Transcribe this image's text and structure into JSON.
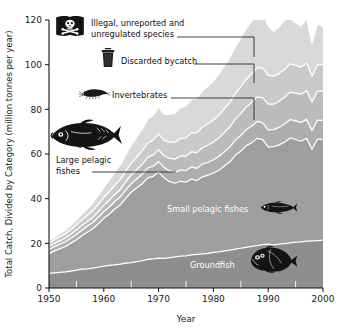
{
  "chart_data": {
    "type": "area",
    "stacked": true,
    "title": "",
    "subtitle": "",
    "xlabel": "Year",
    "ylabel": "Total Catch, Divided by Category (million tonnes per year)",
    "xlim": [
      1950,
      2000
    ],
    "ylim": [
      0,
      120
    ],
    "ytick_values": [
      0,
      20,
      40,
      60,
      80,
      100,
      120
    ],
    "ytick_labels": [
      "0",
      "20",
      "40",
      "60",
      "80",
      "100",
      "120"
    ],
    "xtick_values": [
      1950,
      1960,
      1970,
      1980,
      1990,
      2000
    ],
    "xtick_labels": [
      "1950",
      "1960",
      "1970",
      "1980",
      "1990",
      "2000"
    ],
    "xminor_values": [
      1955,
      1965,
      1975,
      1985,
      1995
    ],
    "grid": false,
    "legend_position": "inside-annotations",
    "x": [
      1950,
      1951,
      1952,
      1953,
      1954,
      1955,
      1956,
      1957,
      1958,
      1959,
      1960,
      1961,
      1962,
      1963,
      1964,
      1965,
      1966,
      1967,
      1968,
      1969,
      1970,
      1971,
      1972,
      1973,
      1974,
      1975,
      1976,
      1977,
      1978,
      1979,
      1980,
      1981,
      1982,
      1983,
      1984,
      1985,
      1986,
      1987,
      1988,
      1989,
      1990,
      1991,
      1992,
      1993,
      1994,
      1995,
      1996,
      1997,
      1998,
      1999,
      2000
    ],
    "series": [
      {
        "name": "Groundfish",
        "color": "#8e8e8e",
        "values": [
          6.5,
          6.8,
          7.0,
          7.2,
          7.6,
          8.0,
          8.4,
          8.6,
          8.9,
          9.3,
          9.8,
          10.1,
          10.4,
          10.7,
          11.1,
          11.4,
          11.8,
          12.2,
          12.8,
          13.0,
          13.4,
          13.3,
          13.6,
          13.9,
          14.3,
          14.4,
          14.8,
          15.1,
          15.3,
          15.5,
          15.9,
          16.2,
          16.6,
          17.0,
          17.4,
          17.8,
          18.2,
          18.6,
          19.0,
          19.4,
          19.6,
          19.3,
          19.6,
          19.9,
          20.2,
          20.5,
          20.7,
          21.0,
          21.1,
          21.2,
          21.4
        ]
      },
      {
        "name": "Small pelagic fishes",
        "color": "#9e9e9e",
        "values": [
          9.0,
          9.8,
          10.6,
          11.4,
          12.5,
          13.6,
          15.0,
          16.4,
          17.6,
          19.5,
          21.4,
          23.0,
          25.0,
          26.5,
          29.0,
          31.5,
          33.0,
          34.5,
          36.5,
          37.0,
          38.5,
          36.0,
          34.0,
          33.0,
          33.5,
          33.0,
          34.0,
          33.0,
          34.5,
          35.0,
          35.5,
          36.5,
          38.0,
          39.5,
          42.0,
          43.5,
          45.5,
          46.5,
          48.0,
          47.0,
          43.5,
          44.0,
          44.5,
          45.5,
          47.0,
          46.0,
          45.0,
          46.0,
          41.0,
          45.5,
          45.0
        ]
      },
      {
        "name": "Large pelagic fishes",
        "color": "#aeaeae",
        "values": [
          1.8,
          1.9,
          2.0,
          2.1,
          2.2,
          2.4,
          2.5,
          2.6,
          2.8,
          2.9,
          3.0,
          3.2,
          3.3,
          3.5,
          3.7,
          3.8,
          4.0,
          4.2,
          4.4,
          4.5,
          4.7,
          4.6,
          4.8,
          4.9,
          5.1,
          5.2,
          5.4,
          5.5,
          5.7,
          5.8,
          6.0,
          6.2,
          6.4,
          6.6,
          6.8,
          7.0,
          7.2,
          7.4,
          7.6,
          7.5,
          7.7,
          7.6,
          7.8,
          8.0,
          8.2,
          8.3,
          8.4,
          8.5,
          8.3,
          8.5,
          8.6
        ]
      },
      {
        "name": "Invertebrates",
        "color": "#bcbcbc",
        "values": [
          1.4,
          1.5,
          1.6,
          1.7,
          1.8,
          2.0,
          2.1,
          2.2,
          2.4,
          2.6,
          2.8,
          3.0,
          3.2,
          3.4,
          3.7,
          3.9,
          4.2,
          4.5,
          4.8,
          5.0,
          5.3,
          5.3,
          5.6,
          5.9,
          6.2,
          6.4,
          6.8,
          7.0,
          7.4,
          7.7,
          8.0,
          8.3,
          8.7,
          9.0,
          9.4,
          9.8,
          10.2,
          10.6,
          11.0,
          11.2,
          11.5,
          11.4,
          11.7,
          12.0,
          12.3,
          12.5,
          12.7,
          12.9,
          12.8,
          13.0,
          13.2
        ]
      },
      {
        "name": "Discarded bycatch",
        "color": "#cacaca",
        "values": [
          1.5,
          1.6,
          1.8,
          1.9,
          2.1,
          2.3,
          2.5,
          2.7,
          3.0,
          3.2,
          3.5,
          3.8,
          4.1,
          4.4,
          4.8,
          5.2,
          5.6,
          6.0,
          6.4,
          6.7,
          7.1,
          7.0,
          7.3,
          7.6,
          8.0,
          8.2,
          8.6,
          8.8,
          9.2,
          9.5,
          9.8,
          10.2,
          10.6,
          11.0,
          11.5,
          11.9,
          12.4,
          12.8,
          13.2,
          13.4,
          13.0,
          12.6,
          12.4,
          12.5,
          12.7,
          12.4,
          12.1,
          12.3,
          11.6,
          11.9,
          11.8
        ]
      },
      {
        "name": "Illegal, unreported and unregulated species",
        "color": "#d9d9d9",
        "values": [
          1.0,
          1.2,
          1.4,
          1.6,
          1.9,
          2.2,
          2.6,
          3.0,
          3.5,
          4.0,
          4.6,
          5.2,
          5.9,
          6.6,
          7.4,
          8.2,
          9.0,
          9.8,
          10.6,
          11.2,
          12.0,
          11.6,
          12.4,
          13.0,
          13.8,
          14.2,
          15.0,
          15.4,
          16.2,
          16.8,
          17.6,
          18.4,
          19.2,
          20.0,
          21.0,
          21.8,
          22.8,
          23.6,
          24.6,
          25.4,
          22.0,
          20.0,
          21.0,
          22.0,
          20.5,
          19.0,
          18.5,
          20.0,
          15.0,
          18.5,
          17.0
        ]
      }
    ],
    "annotations": [
      {
        "id": "iuu",
        "label_line1": "Illegal, unreported and",
        "label_line2": "unregulated species",
        "icon": "pirate-flag-icon",
        "target_year": 1989
      },
      {
        "id": "bycatch",
        "label_line1": "Discarded bycatch",
        "label_line2": "",
        "icon": "trash-can-icon",
        "target_year": 1989
      },
      {
        "id": "invertebrates",
        "label_line1": "Invertebrates",
        "label_line2": "",
        "icon": "shrimp-icon",
        "target_year": 1989
      },
      {
        "id": "large-pelagic",
        "label_line1": "Large pelagic",
        "label_line2": "fishes",
        "icon": "tuna-icon",
        "target_year": 1971
      },
      {
        "id": "small-pelagic",
        "label_line1": "Small pelagic fishes",
        "label_line2": "",
        "icon": "herring-icon",
        "target_year": 1992
      },
      {
        "id": "groundfish",
        "label_line1": "Groundfish",
        "label_line2": "",
        "icon": "flatfish-icon",
        "target_year": 1993
      }
    ]
  },
  "axes": {
    "x_title": "Year",
    "y_title": "Total Catch, Divided by Category (million tonnes per year)"
  },
  "colors": {
    "background": "#ffffff",
    "axis": "#111111",
    "separator": "#ffffff",
    "leader": "#2b2b2b",
    "icon": "#141414"
  }
}
